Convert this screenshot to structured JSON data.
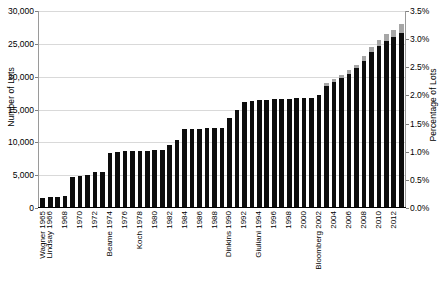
{
  "chart_data": {
    "type": "bar",
    "title": "",
    "xlabel": "",
    "ylabel": "Number of Lots",
    "ylabel_right": "Percentage of Lots",
    "grid": true,
    "legend": "none",
    "ylim": [
      0,
      30000
    ],
    "ylim_right": [
      0,
      3.5
    ],
    "ytick_labels_left": [
      "30,000",
      "25,000",
      "20,000",
      "15,000",
      "10,000",
      "5,000",
      "0"
    ],
    "ytick_values_left": [
      30000,
      25000,
      20000,
      15000,
      10000,
      5000,
      0
    ],
    "ytick_labels_right": [
      "3.5%",
      "3.0%",
      "2.5%",
      "2.0%",
      "1.5%",
      "1.0%",
      "0.5%",
      "0.0%"
    ],
    "ytick_values_right": [
      3.5,
      3.0,
      2.5,
      2.0,
      1.5,
      1.0,
      0.5,
      0.0
    ],
    "categories": [
      "Wagner 1965",
      "Lindsay 1966",
      "1967",
      "1968",
      "1969",
      "1970",
      "1971",
      "1972",
      "1973",
      "Beame 1974",
      "1975",
      "1976",
      "1977",
      "Koch 1978",
      "1979",
      "1980",
      "1981",
      "1982",
      "1983",
      "1984",
      "1985",
      "1986",
      "1987",
      "1988",
      "1989",
      "Dinkins 1990",
      "1991",
      "1992",
      "1993",
      "Giuliani 1994",
      "1995",
      "1996",
      "1997",
      "1998",
      "1999",
      "2000",
      "2001",
      "Bloomberg 2002",
      "2003",
      "2004",
      "2005",
      "2006",
      "2007",
      "2008",
      "2009",
      "2010",
      "2011",
      "2012",
      "2013"
    ],
    "tick_label_visible": [
      "Wagner 1965",
      "Lindsay 1966",
      "",
      "1968",
      "",
      "1970",
      "",
      "1972",
      "",
      "Beame 1974",
      "",
      "1976",
      "",
      "Koch 1978",
      "",
      "1980",
      "",
      "1982",
      "",
      "1984",
      "",
      "1986",
      "",
      "1988",
      "",
      "Dinkins 1990",
      "",
      "1992",
      "",
      "Giuliani 1994",
      "",
      "1996",
      "",
      "1998",
      "",
      "2000",
      "",
      "Bloomberg 2002",
      "",
      "2004",
      "",
      "2006",
      "",
      "2008",
      "",
      "2010",
      "",
      "2012",
      ""
    ],
    "series": [
      {
        "name": "Number of Lots",
        "color": "#0d0d0d",
        "values": [
          1400,
          1500,
          1550,
          1750,
          4550,
          4700,
          4850,
          5350,
          5400,
          8300,
          8400,
          8500,
          8600,
          8550,
          8600,
          8700,
          8750,
          9500,
          10200,
          11900,
          11900,
          11950,
          12000,
          12050,
          12100,
          13500,
          14700,
          16000,
          16150,
          16300,
          16350,
          16400,
          16450,
          16500,
          16550,
          16600,
          16650,
          17000,
          18500,
          19100,
          19600,
          20300,
          21100,
          22300,
          23600,
          24500,
          25300,
          25900,
          26500
        ]
      },
      {
        "name": "Additional (gray top)",
        "color": "#a6a6a6",
        "values": [
          0,
          0,
          0,
          0,
          0,
          0,
          0,
          0,
          0,
          0,
          0,
          0,
          0,
          0,
          0,
          0,
          0,
          0,
          0,
          0,
          0,
          0,
          0,
          0,
          0,
          0,
          0,
          0,
          0,
          0,
          0,
          0,
          0,
          0,
          0,
          0,
          0,
          0,
          350,
          400,
          450,
          500,
          600,
          700,
          800,
          900,
          1000,
          1100,
          1300
        ]
      }
    ]
  }
}
